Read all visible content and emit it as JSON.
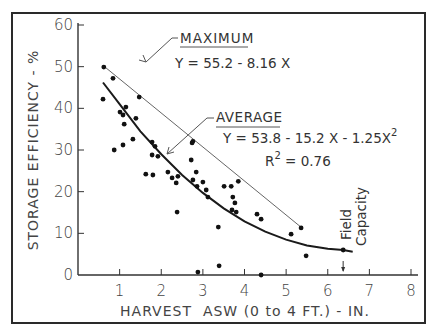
{
  "chart_data": {
    "type": "scatter",
    "title": "",
    "xlabel": "HARVEST  ASW (0 to 4 FT.) - IN.",
    "ylabel": "STORAGE  EFFICIENCY - %",
    "xlim": [
      0,
      8
    ],
    "ylim": [
      0,
      60
    ],
    "x_ticks": [
      1,
      2,
      3,
      4,
      5,
      6,
      7,
      8
    ],
    "x_tick_labels": [
      "1",
      "2",
      "3",
      "4",
      "5",
      "6",
      "7",
      "8"
    ],
    "y_ticks": [
      0,
      10,
      20,
      30,
      40,
      50,
      60
    ],
    "y_tick_labels": [
      "0",
      "10",
      "20",
      "30",
      "40",
      "50",
      "60"
    ],
    "grid": false,
    "series": [
      {
        "name": "Observations",
        "kind": "points",
        "points": [
          [
            0.62,
            49.9
          ],
          [
            0.84,
            47.2
          ],
          [
            1.47,
            42.7
          ],
          [
            0.6,
            42.2
          ],
          [
            1.15,
            40.3
          ],
          [
            1.01,
            39.1
          ],
          [
            1.08,
            38.4
          ],
          [
            1.11,
            36.2
          ],
          [
            1.39,
            37.6
          ],
          [
            0.87,
            30.0
          ],
          [
            1.08,
            31.2
          ],
          [
            1.32,
            32.6
          ],
          [
            1.78,
            31.9
          ],
          [
            1.85,
            30.9
          ],
          [
            1.78,
            28.8
          ],
          [
            1.92,
            28.5
          ],
          [
            1.8,
            24.0
          ],
          [
            1.63,
            24.2
          ],
          [
            2.16,
            24.7
          ],
          [
            2.26,
            23.3
          ],
          [
            2.36,
            22.1
          ],
          [
            2.4,
            23.7
          ],
          [
            2.38,
            15.1
          ],
          [
            2.84,
            24.7
          ],
          [
            2.72,
            27.6
          ],
          [
            2.76,
            22.8
          ],
          [
            2.86,
            21.3
          ],
          [
            3.0,
            22.3
          ],
          [
            3.08,
            20.4
          ],
          [
            3.12,
            18.7
          ],
          [
            2.76,
            32.1
          ],
          [
            2.74,
            31.7
          ],
          [
            3.37,
            11.5
          ],
          [
            3.39,
            2.2
          ],
          [
            2.88,
            0.7
          ],
          [
            3.51,
            21.3
          ],
          [
            3.68,
            21.3
          ],
          [
            3.85,
            22.5
          ],
          [
            3.72,
            18.7
          ],
          [
            3.77,
            17.3
          ],
          [
            3.7,
            15.6
          ],
          [
            3.8,
            15.1
          ],
          [
            4.3,
            14.6
          ],
          [
            4.4,
            13.4
          ],
          [
            4.4,
            0.0
          ],
          [
            5.12,
            9.8
          ],
          [
            5.36,
            11.3
          ],
          [
            5.48,
            4.6
          ],
          [
            6.37,
            6.0
          ]
        ]
      },
      {
        "name": "Maximum",
        "kind": "line",
        "equation": "Y = 55.2 - 8.16 X",
        "intercept": 55.2,
        "slope": -8.16,
        "x_range": [
          0.62,
          5.36
        ]
      },
      {
        "name": "Average",
        "kind": "curve",
        "equation": "Y = 53.8 - 15.2 X - 1.25X²",
        "r_squared": 0.76,
        "x_range": [
          0.6,
          6.6
        ],
        "curve_points": [
          [
            0.6,
            46.2
          ],
          [
            1.0,
            41.0
          ],
          [
            1.5,
            34.5
          ],
          [
            2.0,
            29.0
          ],
          [
            2.5,
            24.0
          ],
          [
            3.0,
            19.7
          ],
          [
            3.5,
            16.0
          ],
          [
            4.0,
            12.9
          ],
          [
            4.5,
            10.4
          ],
          [
            5.0,
            8.5
          ],
          [
            5.5,
            7.1
          ],
          [
            6.0,
            6.3
          ],
          [
            6.37,
            6.0
          ],
          [
            6.6,
            5.6
          ]
        ]
      }
    ],
    "annotations": {
      "maximum_label": "MAXIMUM",
      "maximum_equation": "Y = 55.2 - 8.16 X",
      "average_label": "AVERAGE",
      "average_equation_main": "Y = 53.8 - 15.2 X - 1.25X",
      "average_equation_exp": "2",
      "r2_main": "R",
      "r2_exp": "2",
      "r2_value": " = 0.76",
      "field_capacity_line1": "Field",
      "field_capacity_line2": "Capacity",
      "field_capacity_x": 6.37
    }
  }
}
